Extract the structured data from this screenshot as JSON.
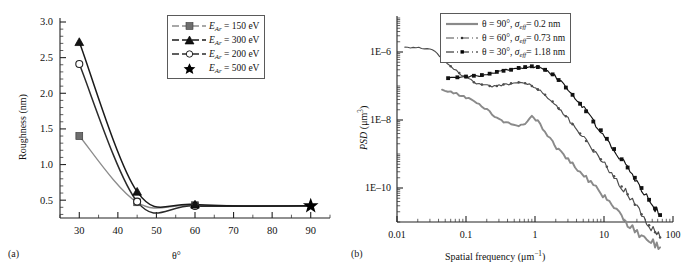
{
  "figure": {
    "panel_a_label": "(a)",
    "panel_b_label": "(b)"
  },
  "chart_data": [
    {
      "id": "panel-a",
      "type": "line",
      "title": "",
      "xlabel": "θ°",
      "ylabel": "Roughness (nm)",
      "xscale": "linear",
      "yscale": "linear",
      "xlim": [
        25,
        95
      ],
      "ylim": [
        0.25,
        3.0
      ],
      "xticks": [
        30,
        40,
        50,
        60,
        70,
        80,
        90
      ],
      "xtick_labels": [
        "30",
        "40",
        "50",
        "60",
        "70",
        "80",
        "90"
      ],
      "yticks": [
        0.5,
        1.0,
        1.5,
        2.0,
        2.5,
        3.0
      ],
      "ytick_labels": [
        "0.5",
        "1.0",
        "1.5",
        "2.0",
        "2.5",
        "3.0"
      ],
      "grid": false,
      "legend_position": "upper right",
      "series": [
        {
          "name": "E_Ar = 150 eV",
          "legend_label_prefix": "E",
          "legend_label_sub": "Ar",
          "legend_label_suffix": " = 150 eV",
          "marker": "filled-square",
          "color": "#8c8c8c",
          "x": [
            30,
            45,
            60,
            90
          ],
          "values": [
            1.4,
            0.47,
            0.43,
            0.42
          ]
        },
        {
          "name": "E_Ar = 300 eV",
          "legend_label_prefix": "E",
          "legend_label_sub": "Ar",
          "legend_label_suffix": " = 300 eV",
          "marker": "filled-triangle",
          "color": "#1a1a1a",
          "x": [
            30,
            45,
            60,
            90
          ],
          "values": [
            2.72,
            0.62,
            0.44,
            0.42
          ]
        },
        {
          "name": "E_Ar = 200 eV",
          "legend_label_prefix": "E",
          "legend_label_sub": "Ar",
          "legend_label_suffix": " = 200 eV",
          "marker": "open-circle",
          "color": "#2b2b2b",
          "x": [
            30,
            45,
            60,
            90
          ],
          "values": [
            2.41,
            0.48,
            0.42,
            0.42
          ]
        },
        {
          "name": "E_Ar = 500 eV",
          "legend_label_prefix": "E",
          "legend_label_sub": "Ar",
          "legend_label_suffix": " = 500 eV",
          "marker": "filled-star",
          "color": "#000000",
          "x": [
            90
          ],
          "values": [
            0.42
          ]
        }
      ]
    },
    {
      "id": "panel-b",
      "type": "line",
      "title": "",
      "xlabel": "Spatial frequency (μm⁻¹)",
      "ylabel": "PSD (μm³)",
      "xscale": "log",
      "yscale": "log",
      "xlim": [
        0.01,
        100
      ],
      "ylim": [
        1e-11,
        1e-05
      ],
      "xticks": [
        0.01,
        0.1,
        1,
        10,
        100
      ],
      "xtick_labels": [
        "0.01",
        "0.1",
        "1",
        "10",
        "100"
      ],
      "yticks": [
        1e-06,
        1e-08,
        1e-10
      ],
      "ytick_labels": [
        "1E–6",
        "1E–8",
        "1E–10"
      ],
      "grid": false,
      "legend_position": "upper right",
      "series": [
        {
          "name": "theta = 90 deg, sigma_eff = 0.2 nm",
          "legend_theta": "θ = 90°, ",
          "legend_sigma": "σ",
          "legend_sigma_sub": "eff",
          "legend_value": "= 0.2 nm",
          "style": "solid",
          "marker": "none",
          "color": "#8a8a8a",
          "x": [
            0.045,
            0.06,
            0.08,
            0.1,
            0.13,
            0.17,
            0.22,
            0.28,
            0.35,
            0.45,
            0.58,
            0.72,
            0.9,
            1.1,
            1.4,
            1.8,
            2.2,
            2.8,
            3.5,
            4.5,
            5.5,
            7,
            9,
            11,
            14,
            18,
            22,
            28,
            35,
            45,
            55,
            65
          ],
          "values": [
            7.5e-08,
            6.5e-08,
            5.5e-08,
            4.5e-08,
            3.6e-08,
            2.6e-08,
            1.7e-08,
            1.1e-08,
            8.5e-09,
            7.5e-09,
            7e-09,
            8e-09,
            1.3e-08,
            9e-09,
            4.5e-09,
            2.2e-09,
            1.3e-09,
            8e-10,
            5e-10,
            3e-10,
            2e-10,
            1.2e-10,
            7e-11,
            4.5e-11,
            2.5e-11,
            1.4e-11,
            9e-12,
            6e-12,
            4e-12,
            3e-12,
            2.2e-12,
            1.8e-12
          ]
        },
        {
          "name": "theta = 60 deg, sigma_eff = 0.73 nm",
          "legend_theta": "θ = 60°, ",
          "legend_sigma": "σ",
          "legend_sigma_sub": "eff",
          "legend_value": "= 0.73 nm",
          "style": "dashdot",
          "marker": "tiny-dot",
          "color": "#4d4d4d",
          "x": [
            0.013,
            0.03,
            0.045,
            0.06,
            0.08,
            0.1,
            0.13,
            0.17,
            0.22,
            0.28,
            0.35,
            0.45,
            0.58,
            0.72,
            0.9,
            1.1,
            1.4,
            1.8,
            2.2,
            2.8,
            3.5,
            4.5,
            5.5,
            7,
            9,
            11,
            14,
            18,
            22,
            28,
            35,
            45,
            55,
            65
          ],
          "values": [
            1.3e-06,
            1.3e-06,
            6.5e-07,
            3.8e-07,
            2.4e-07,
            1.8e-07,
            1.3e-07,
            1.1e-07,
            1e-07,
            1e-07,
            1.1e-07,
            1.2e-07,
            1.3e-07,
            1.2e-07,
            1e-07,
            8e-08,
            5.5e-08,
            3.5e-08,
            2.2e-08,
            1.3e-08,
            7.5e-09,
            4e-09,
            2.4e-09,
            1.3e-09,
            7e-10,
            4.2e-10,
            2.2e-10,
            1.1e-10,
            6.5e-11,
            3.2e-11,
            1.7e-11,
            8e-12,
            5e-12,
            3.5e-12
          ]
        },
        {
          "name": "theta = 30 deg, sigma_eff = 1.18 nm",
          "legend_theta": "θ = 30°, ",
          "legend_sigma": "σ",
          "legend_sigma_sub": "eff",
          "legend_value": "= 1.18 nm",
          "style": "dashdot",
          "marker": "small-square",
          "color": "#111111",
          "x": [
            0.055,
            0.075,
            0.1,
            0.13,
            0.17,
            0.22,
            0.28,
            0.35,
            0.45,
            0.58,
            0.72,
            0.9,
            1.1,
            1.4,
            1.8,
            2.2,
            2.8,
            3.5,
            4.5,
            5.5,
            7,
            9,
            11,
            14,
            18,
            22,
            28,
            35,
            45,
            55,
            65
          ],
          "values": [
            1.7e-07,
            1.8e-07,
            1.9e-07,
            2e-07,
            2.1e-07,
            2.3e-07,
            2.6e-07,
            2.8e-07,
            3e-07,
            3.4e-07,
            3.6e-07,
            3.8e-07,
            3.6e-07,
            3e-07,
            2.2e-07,
            1.5e-07,
            9e-08,
            5.5e-08,
            3e-08,
            1.8e-08,
            9e-09,
            5e-09,
            2.8e-09,
            1.4e-09,
            7e-10,
            4e-10,
            2e-10,
            1e-10,
            4.5e-11,
            2.5e-11,
            1.6e-11
          ]
        }
      ]
    }
  ]
}
